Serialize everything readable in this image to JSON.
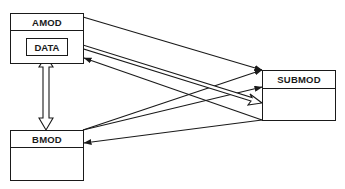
{
  "diagram": {
    "modules": {
      "amod": {
        "label": "AMOD",
        "inner": {
          "label": "DATA"
        }
      },
      "bmod": {
        "label": "BMOD"
      },
      "submod": {
        "label": "SUBMOD"
      }
    },
    "connections": [
      {
        "from": "AMOD",
        "to": "SUBMOD",
        "style": "line-arrow"
      },
      {
        "from": "DATA",
        "to": "SUBMOD",
        "style": "hollow-double-arrow",
        "bidirectional": true
      },
      {
        "from": "SUBMOD",
        "to": "AMOD",
        "style": "line-arrow"
      },
      {
        "from": "BMOD",
        "to": "SUBMOD",
        "style": "line-arrow"
      },
      {
        "from": "BMOD",
        "to": "SUBMOD",
        "style": "line-arrow"
      },
      {
        "from": "SUBMOD",
        "to": "BMOD",
        "style": "line-arrow"
      },
      {
        "from": "DATA",
        "to": "BMOD",
        "style": "hollow-double-arrow",
        "bidirectional": true
      }
    ],
    "colors": {
      "stroke": "#1a1a1a",
      "background": "#ffffff"
    }
  }
}
